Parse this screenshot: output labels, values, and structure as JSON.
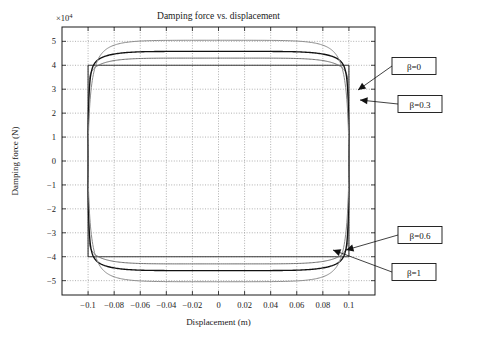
{
  "chart_data": {
    "type": "line",
    "title": "Damping force vs. displacement",
    "xlabel": "Displacement (m)",
    "ylabel": "Damping force (N)",
    "y_exponent_label": "×10",
    "y_exponent_sup": "4",
    "y_scale": 10000,
    "xlim": [
      -0.12,
      0.12
    ],
    "ylim": [
      -5.6,
      5.6
    ],
    "xticks": [
      -0.1,
      -0.08,
      -0.06,
      -0.04,
      -0.02,
      0,
      0.02,
      0.04,
      0.06,
      0.08,
      0.1
    ],
    "xticklabels": [
      "−0.1",
      "−0.08",
      "−0.06",
      "−0.04",
      "−0.02",
      "0",
      "0.02",
      "0.04",
      "0.06",
      "0.08",
      "0.1"
    ],
    "yticks": [
      -5,
      -4,
      -3,
      -2,
      -1,
      0,
      1,
      2,
      3,
      4,
      5
    ],
    "yticklabels": [
      "−5",
      "−4",
      "−3",
      "−2",
      "−1",
      "0",
      "1",
      "2",
      "3",
      "4",
      "5"
    ],
    "grid": true,
    "grid_style": "dotted",
    "legend_position": "annotations-right",
    "amplitude": 0.1,
    "series": [
      {
        "name": "β=0",
        "beta": 0,
        "color": "#3a3a3a",
        "width": 1.15,
        "shape": "rectangle",
        "plateau": 4.0,
        "note": "Coulomb friction: ideal rectangular hysteresis loop, force ±4×10^4 N"
      },
      {
        "name": "β=0.3",
        "beta": 0.3,
        "color": "#6e6e6e",
        "width": 1.0,
        "shape": "loop",
        "peak": 4.3,
        "crossing_x": 0.06,
        "crossing_y": 4.0,
        "knee": 0.965
      },
      {
        "name": "β=0.6",
        "beta": 0.6,
        "color": "#111111",
        "width": 1.35,
        "shape": "loop",
        "peak": 4.58,
        "crossing_x": 0.06,
        "crossing_y": 4.0,
        "knee": 0.93
      },
      {
        "name": "β=1",
        "beta": 1,
        "color": "#8a8a8a",
        "width": 1.0,
        "shape": "loop",
        "peak": 5.05,
        "crossing_x": 0.06,
        "crossing_y": 4.0,
        "knee": 0.86
      }
    ],
    "annotations": [
      {
        "label": "β=0",
        "box_x": 414,
        "box_y": 66,
        "tip_x": 358,
        "tip_y": 90
      },
      {
        "label": "β=0.3",
        "box_x": 420,
        "box_y": 104,
        "tip_x": 360,
        "tip_y": 100
      },
      {
        "label": "β=0.6",
        "box_x": 420,
        "box_y": 235,
        "tip_x": 346,
        "tip_y": 250
      },
      {
        "label": "β=1",
        "box_x": 414,
        "box_y": 272,
        "tip_x": 333,
        "tip_y": 250
      }
    ]
  }
}
